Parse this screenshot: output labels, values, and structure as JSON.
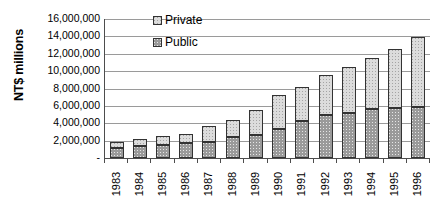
{
  "chart_data": {
    "type": "bar",
    "subtype": "stacked-bar",
    "title": "",
    "xlabel": "",
    "ylabel": "NT$ millions",
    "ylim": [
      0,
      16000000
    ],
    "ytick_step": 2000000,
    "grid": true,
    "legend_position": "inside-top-left",
    "categories": [
      "1983",
      "1984",
      "1985",
      "1986",
      "1987",
      "1988",
      "1989",
      "1990",
      "1991",
      "1992",
      "1993",
      "1994",
      "1995",
      "1996"
    ],
    "ytick_labels": [
      "16,000,000",
      "14,000,000",
      "12,000,000",
      "10,000,000",
      "8,000,000",
      "6,000,000",
      "4,000,000",
      "2,000,000",
      "-"
    ],
    "ytick_values": [
      16000000,
      14000000,
      12000000,
      10000000,
      8000000,
      6000000,
      4000000,
      2000000,
      0
    ],
    "series": [
      {
        "name": "Public",
        "color": "#9a9a9a",
        "values": [
          1150000,
          1350000,
          1550000,
          1700000,
          1850000,
          2450000,
          2600000,
          3300000,
          4250000,
          4950000,
          5150000,
          5600000,
          5700000,
          5900000
        ]
      },
      {
        "name": "Private",
        "color": "#dcdcdc",
        "values": [
          700000,
          850000,
          950000,
          1100000,
          1800000,
          1950000,
          2900000,
          3900000,
          3950000,
          4600000,
          5300000,
          5950000,
          6850000,
          8050000
        ]
      }
    ],
    "totals": [
      1850000,
      2200000,
      2500000,
      2800000,
      3650000,
      4400000,
      5500000,
      7200000,
      8200000,
      9550000,
      10450000,
      11550000,
      12550000,
      13950000
    ]
  },
  "legend": {
    "entries": [
      {
        "label": "Private",
        "swatch_name": "legend-swatch-private"
      },
      {
        "label": "Public",
        "swatch_name": "legend-swatch-public"
      }
    ]
  },
  "axes": {
    "y_title": "NT$ millions"
  }
}
